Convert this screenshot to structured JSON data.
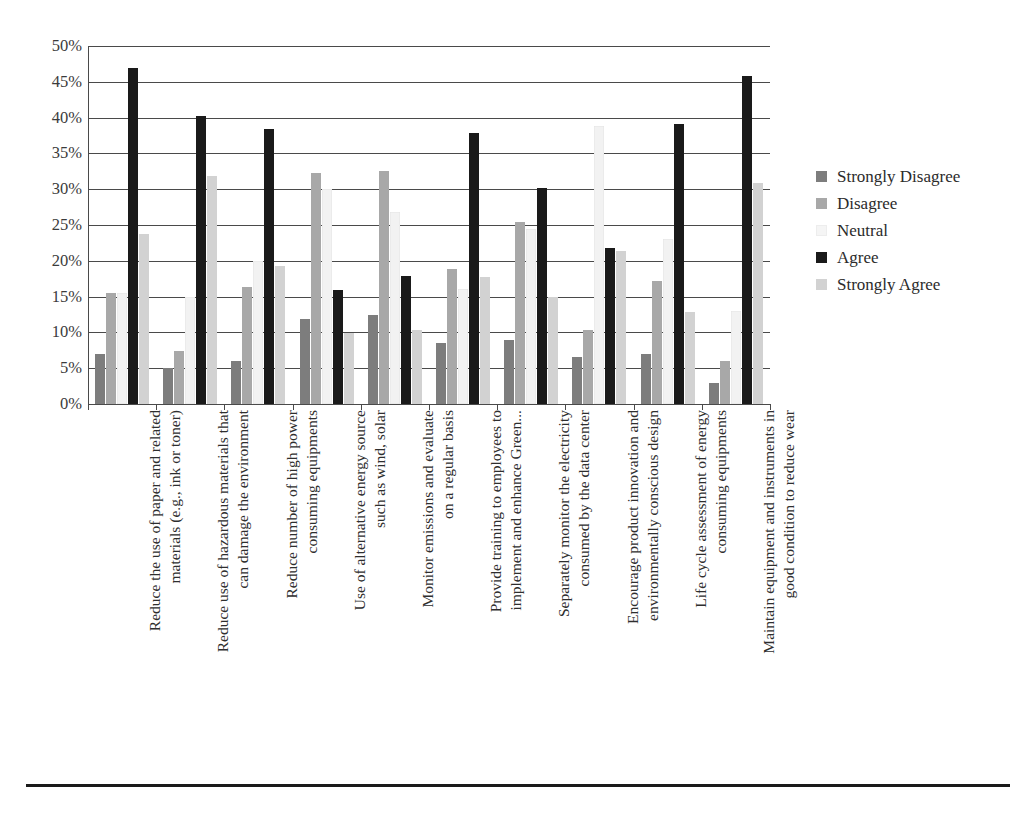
{
  "chart_data": {
    "type": "bar",
    "title": "",
    "subtitle": "",
    "xlabel": "",
    "ylabel": "",
    "ylim": [
      0,
      50
    ],
    "ytick_labels": [
      "0%",
      "5%",
      "10%",
      "15%",
      "20%",
      "25%",
      "30%",
      "35%",
      "40%",
      "45%",
      "50%"
    ],
    "ytick_values": [
      0,
      5,
      10,
      15,
      20,
      25,
      30,
      35,
      40,
      45,
      50
    ],
    "grid": true,
    "legend_position": "right",
    "orientation": "vertical",
    "grouped": true,
    "categories": [
      "Reduce the use of paper and related materials (e.g., ink or toner)",
      "Reduce use of hazardous materials that can damage the environment",
      "Reduce number of high power consuming equipments",
      "Use of alternative energy source such as wind, solar",
      "Monitor emissions and evaluate on a regular basis",
      "Provide training to employees to implement and enhance Green...",
      "Separately monitor the electricity consumed by the data center",
      "Encourage product innovation and environmentally conscious design",
      "Life cycle assessment of energy consuming equipments",
      "Maintain equipment and instruments in good condition to reduce wear"
    ],
    "category_lines": [
      [
        "Reduce the use of paper and related",
        "materials (e.g., ink or toner)"
      ],
      [
        "Reduce use of hazardous materials that",
        "can damage the environment"
      ],
      [
        "Reduce number of high power",
        "consuming equipments"
      ],
      [
        "Use of alternative energy source",
        "such as wind, solar"
      ],
      [
        "Monitor emissions and evaluate",
        "on a regular basis"
      ],
      [
        "Provide training to employees to",
        "implement and enhance Green..."
      ],
      [
        "Separately monitor the electricity",
        "consumed by the data center"
      ],
      [
        "Encourage product innovation and",
        "environmentally conscious design"
      ],
      [
        "Life cycle assessment of energy",
        "consuming equipments"
      ],
      [
        "Maintain equipment and instruments in",
        "good condition to reduce wear"
      ]
    ],
    "series": [
      {
        "name": "Strongly Disagree",
        "color": "#7d7d7d",
        "values": [
          7.0,
          5.0,
          6.0,
          11.9,
          12.4,
          8.5,
          8.9,
          6.6,
          7.0,
          2.9
        ]
      },
      {
        "name": "Disagree",
        "color": "#a8a8a8",
        "values": [
          15.5,
          7.4,
          16.3,
          32.3,
          32.5,
          18.9,
          25.4,
          10.4,
          17.2,
          6.0
        ]
      },
      {
        "name": "Neutral",
        "color": "#f2f2f2",
        "values": [
          15.5,
          15.0,
          20.0,
          30.0,
          26.8,
          16.0,
          24.4,
          38.8,
          23.1,
          13.0
        ]
      },
      {
        "name": "Agree",
        "color": "#1a1a1a",
        "values": [
          46.9,
          40.2,
          38.4,
          15.9,
          17.9,
          37.9,
          30.2,
          21.8,
          39.1,
          45.8
        ]
      },
      {
        "name": "Strongly Agree",
        "color": "#d2d2d2",
        "values": [
          23.7,
          31.9,
          19.3,
          9.9,
          10.4,
          17.8,
          14.9,
          21.4,
          12.9,
          30.9
        ]
      }
    ]
  },
  "legend": {
    "items": [
      {
        "label": "Strongly Disagree",
        "color": "#7d7d7d"
      },
      {
        "label": "Disagree",
        "color": "#a8a8a8"
      },
      {
        "label": "Neutral",
        "color": "#f5f5f5"
      },
      {
        "label": "Agree",
        "color": "#1a1a1a"
      },
      {
        "label": "Strongly Agree",
        "color": "#d2d2d2"
      }
    ]
  },
  "colors": {
    "axis": "#4a4a4a",
    "grid": "#4a4a4a",
    "text": "#2e2e2e",
    "rule": "#1a1a1a",
    "background": "#ffffff"
  }
}
